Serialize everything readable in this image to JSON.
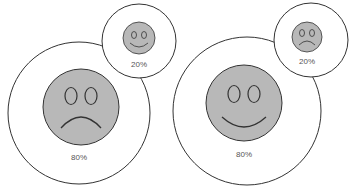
{
  "diagrams": [
    {
      "name": "left",
      "main": {
        "mood": "sad",
        "label": "80%"
      },
      "inset": {
        "mood": "happy",
        "label": "20%"
      }
    },
    {
      "name": "right",
      "main": {
        "mood": "happy",
        "label": "80%"
      },
      "inset": {
        "mood": "sad",
        "label": "20%"
      }
    }
  ],
  "colors": {
    "face_fill": "#b8b8b8",
    "stroke": "#333333",
    "circle_fill": "#ffffff"
  }
}
